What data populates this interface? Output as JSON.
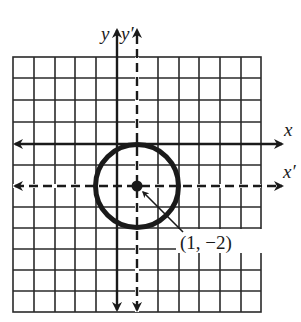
{
  "diagram": {
    "type": "coordinate-translation-circle",
    "grid": {
      "columns": 12,
      "rows": 12,
      "line_color": "#2a2a2a"
    },
    "axes": {
      "original": {
        "x_label": "x",
        "y_label": "y",
        "style": "solid"
      },
      "translated": {
        "x_label": "x′",
        "y_label": "y′",
        "style": "dashed"
      }
    },
    "circle": {
      "center_label": "(1, −2)",
      "center": [
        1,
        -2
      ],
      "radius": 2,
      "stroke_color": "#1a1a1a"
    },
    "colors": {
      "ink": "#1a1a1a",
      "background": "#ffffff"
    }
  }
}
